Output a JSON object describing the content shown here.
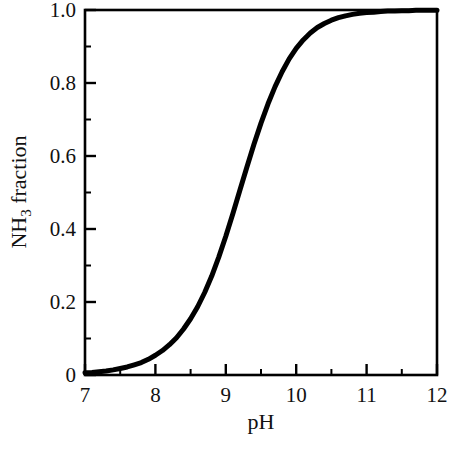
{
  "chart_data": {
    "type": "line",
    "title": "",
    "subtitle": "",
    "xlabel": "pH",
    "ylabel": "NH3 fraction",
    "ylabel_parts": {
      "pre": "NH",
      "sub": "3",
      "post": " fraction"
    },
    "xlim": [
      7,
      12
    ],
    "ylim": [
      0,
      1.0
    ],
    "grid": false,
    "legend": "none",
    "x_ticks": [
      7,
      8,
      9,
      10,
      11,
      12
    ],
    "x_tick_labels": [
      "7",
      "8",
      "9",
      "10",
      "11",
      "12"
    ],
    "x_minor_ticks": [
      7.5,
      8.5,
      9.5,
      10.5,
      11.5
    ],
    "y_ticks": [
      0,
      0.2,
      0.4,
      0.6,
      0.8,
      1.0
    ],
    "y_tick_labels": [
      "0",
      "0.2",
      "0.4",
      "0.6",
      "0.8",
      "1.0"
    ],
    "y_minor_ticks": [
      0.1,
      0.3,
      0.5,
      0.7,
      0.9
    ],
    "series": [
      {
        "name": "NH3 fraction",
        "color": "#000000",
        "line_width": 5,
        "x": [
          7.0,
          7.1,
          7.2,
          7.3,
          7.4,
          7.5,
          7.6,
          7.7,
          7.8,
          7.9,
          8.0,
          8.1,
          8.2,
          8.3,
          8.4,
          8.5,
          8.6,
          8.7,
          8.8,
          8.9,
          9.0,
          9.1,
          9.2,
          9.3,
          9.4,
          9.5,
          9.6,
          9.7,
          9.8,
          9.9,
          10.0,
          10.1,
          10.2,
          10.3,
          10.4,
          10.5,
          10.6,
          10.7,
          10.8,
          10.9,
          11.0,
          11.1,
          11.2,
          11.3,
          11.4,
          11.5,
          11.6,
          11.7,
          11.8,
          11.9,
          12.0
        ],
        "y": [
          0.006,
          0.007,
          0.009,
          0.011,
          0.014,
          0.018,
          0.022,
          0.028,
          0.034,
          0.043,
          0.054,
          0.067,
          0.083,
          0.102,
          0.126,
          0.154,
          0.187,
          0.226,
          0.271,
          0.323,
          0.38,
          0.442,
          0.506,
          0.57,
          0.632,
          0.69,
          0.743,
          0.79,
          0.831,
          0.866,
          0.895,
          0.918,
          0.937,
          0.952,
          0.963,
          0.972,
          0.979,
          0.984,
          0.988,
          0.991,
          0.993,
          0.994,
          0.996,
          0.997,
          0.997,
          0.998,
          0.998,
          0.999,
          0.999,
          0.999,
          0.999
        ],
        "model": "NH3 fraction = 1 / (1 + 10^(pKa - pH)), pKa = 9.25"
      }
    ],
    "annotations": [],
    "axis": {
      "frame": true,
      "tick_direction": "in",
      "axis_color": "#000000"
    }
  }
}
